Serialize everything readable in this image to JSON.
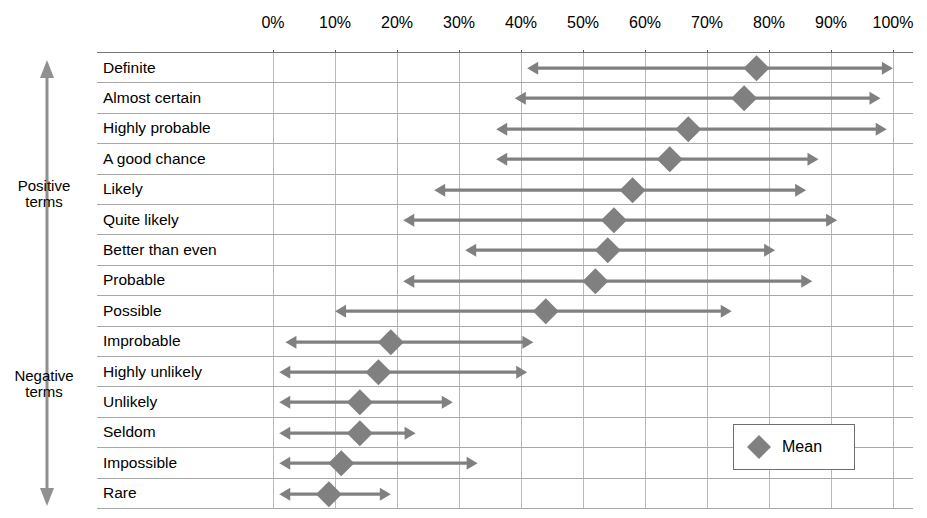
{
  "axis": {
    "side_positive": "Positive\nterms",
    "side_positive_line1": "Positive",
    "side_positive_line2": "terms",
    "side_negative_line1": "Negative",
    "side_negative_line2": "terms"
  },
  "legend": {
    "label": "Mean",
    "marker": "diamond-marker"
  },
  "colors": {
    "marker": "#808080",
    "arrow": "#808080",
    "grid": "#b9b9b9",
    "row_rule": "#a8a8a8",
    "axis": "#777777",
    "text": "#000000"
  },
  "chart_data": {
    "type": "range-with-mean",
    "title": "",
    "xlabel": "",
    "ylabel": "",
    "xlim": [
      0,
      100
    ],
    "xticks": [
      0,
      10,
      20,
      30,
      40,
      50,
      60,
      70,
      80,
      90,
      100
    ],
    "xtick_labels": [
      "0%",
      "10%",
      "20%",
      "30%",
      "40%",
      "50%",
      "60%",
      "70%",
      "80%",
      "90%",
      "100%"
    ],
    "grid": true,
    "legend_position": "bottom-right",
    "legend_entries": [
      "Mean"
    ],
    "group_labels": [
      "Positive terms",
      "Negative terms"
    ],
    "categories": [
      "Definite",
      "Almost certain",
      "Highly probable",
      "A good chance",
      "Likely",
      "Quite likely",
      "Better than even",
      "Probable",
      "Possible",
      "Improbable",
      "Highly unlikely",
      "Unlikely",
      "Seldom",
      "Impossible",
      "Rare"
    ],
    "rows": [
      {
        "label": "Definite",
        "group": "Positive terms",
        "low": 41,
        "mean": 78,
        "high": 100
      },
      {
        "label": "Almost certain",
        "group": "Positive terms",
        "low": 39,
        "mean": 76,
        "high": 98
      },
      {
        "label": "Highly probable",
        "group": "Positive terms",
        "low": 36,
        "mean": 67,
        "high": 99
      },
      {
        "label": "A good chance",
        "group": "Positive terms",
        "low": 36,
        "mean": 64,
        "high": 88
      },
      {
        "label": "Likely",
        "group": "Positive terms",
        "low": 26,
        "mean": 58,
        "high": 86
      },
      {
        "label": "Quite likely",
        "group": "Positive terms",
        "low": 21,
        "mean": 55,
        "high": 91
      },
      {
        "label": "Better than even",
        "group": "Positive terms",
        "low": 31,
        "mean": 54,
        "high": 81
      },
      {
        "label": "Probable",
        "group": "Positive terms",
        "low": 21,
        "mean": 52,
        "high": 87
      },
      {
        "label": "Possible",
        "group": "Positive terms",
        "low": 10,
        "mean": 44,
        "high": 74
      },
      {
        "label": "Improbable",
        "group": "Negative terms",
        "low": 2,
        "mean": 19,
        "high": 42
      },
      {
        "label": "Highly unlikely",
        "group": "Negative terms",
        "low": 1,
        "mean": 17,
        "high": 41
      },
      {
        "label": "Unlikely",
        "group": "Negative terms",
        "low": 1,
        "mean": 14,
        "high": 29
      },
      {
        "label": "Seldom",
        "group": "Negative terms",
        "low": 1,
        "mean": 14,
        "high": 23
      },
      {
        "label": "Impossible",
        "group": "Negative terms",
        "low": 1,
        "mean": 11,
        "high": 33
      },
      {
        "label": "Rare",
        "group": "Negative terms",
        "low": 1,
        "mean": 9,
        "high": 19
      }
    ]
  }
}
